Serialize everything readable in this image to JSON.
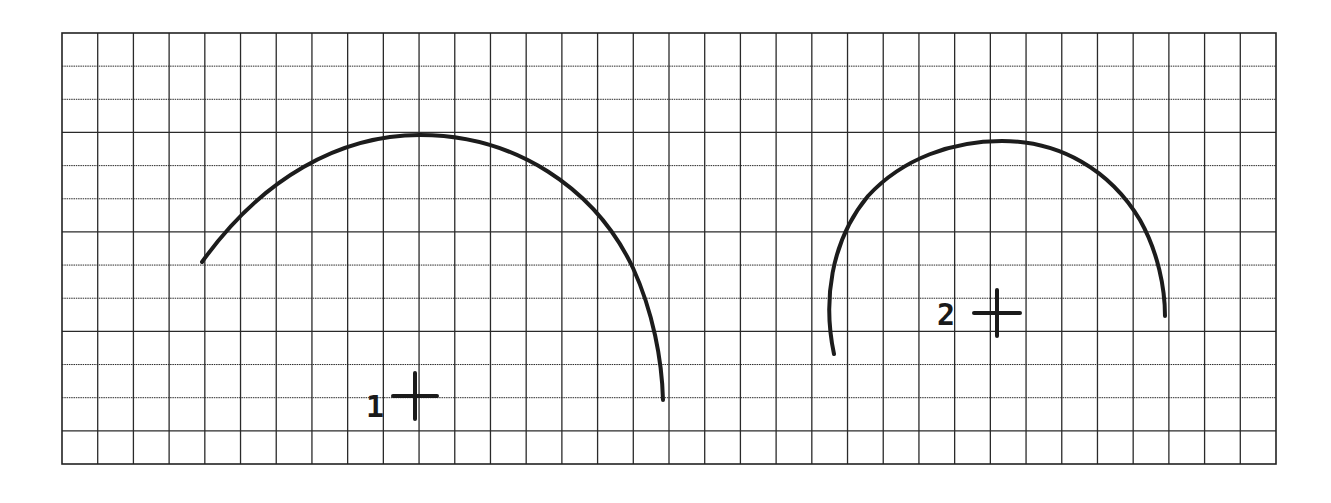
{
  "diagram": {
    "type": "grid-arcs",
    "grid": {
      "left": 62,
      "top": 33,
      "right": 1276,
      "bottom": 464,
      "columns": 34,
      "rows": 13,
      "line_color": "#2a2a2a",
      "frame_color": "#222222"
    },
    "arcs": [
      {
        "id": "arc-1",
        "path": "M202,262 C262,178 340,135 420,135 C515,135 595,188 633,268 C653,312 662,360 663,400",
        "stroke": "#1c1c1c",
        "stroke_width": 4
      },
      {
        "id": "arc-2",
        "path": "M834,354 C823,302 830,242 868,196 C903,158 953,141 1002,141 C1060,141 1110,170 1140,220 C1158,252 1165,288 1165,316",
        "stroke": "#1c1c1c",
        "stroke_width": 4
      }
    ],
    "markers": [
      {
        "id": "center-1",
        "label": "1",
        "cx": 415,
        "cy": 396,
        "half_w": 22,
        "half_h": 23,
        "label_x": 366,
        "label_y": 417
      },
      {
        "id": "center-2",
        "label": "2",
        "cx": 997,
        "cy": 313,
        "half_w": 23,
        "half_h": 23,
        "label_x": 937,
        "label_y": 325
      }
    ]
  }
}
